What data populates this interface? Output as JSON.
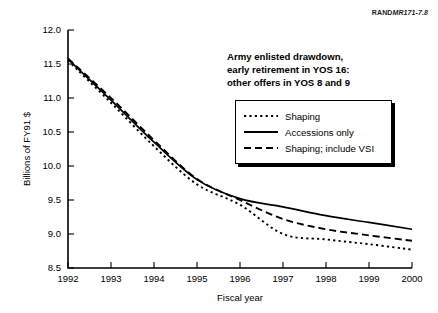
{
  "source_id": {
    "prefix": "RAND",
    "code": "MR171-7.8"
  },
  "annotation": {
    "line1": "Army enlisted drawdown,",
    "line2": "early retirement in YOS 16:",
    "line3": "other offers in YOS 8 and 9"
  },
  "legend": {
    "items": [
      {
        "label": "Shaping",
        "style": "dotted"
      },
      {
        "label": "Accessions only",
        "style": "solid"
      },
      {
        "label": "Shaping; include VSI",
        "style": "dashed"
      }
    ]
  },
  "chart_data": {
    "type": "line",
    "title": "",
    "xlabel": "Fiscal year",
    "ylabel": "Billions of FY91 $",
    "x": [
      1992,
      1993,
      1994,
      1995,
      1996,
      1997,
      1998,
      1999,
      2000
    ],
    "xtick_labels": [
      "1992",
      "1993",
      "1994",
      "1995",
      "1996",
      "1997",
      "1998",
      "1999",
      "2000"
    ],
    "ytick_labels": [
      "8.5",
      "9.0",
      "9.5",
      "10.0",
      "10.5",
      "11.0",
      "11.5",
      "12.0"
    ],
    "ytick_values": [
      8.5,
      9.0,
      9.5,
      10.0,
      10.5,
      11.0,
      11.5,
      12.0
    ],
    "xlim": [
      1992,
      2000
    ],
    "ylim": [
      8.5,
      12.0
    ],
    "grid": false,
    "legend_position": "upper right",
    "series": [
      {
        "name": "Shaping",
        "style": "dotted",
        "values": [
          11.55,
          10.93,
          10.29,
          9.73,
          9.43,
          9.0,
          8.92,
          8.85,
          8.77
        ]
      },
      {
        "name": "Accessions only",
        "style": "solid",
        "values": [
          11.57,
          10.97,
          10.35,
          9.8,
          9.52,
          9.4,
          9.27,
          9.17,
          9.07
        ]
      },
      {
        "name": "Shaping; include VSI",
        "style": "dashed",
        "values": [
          11.58,
          11.0,
          10.38,
          9.81,
          9.5,
          9.22,
          9.07,
          8.98,
          8.9
        ]
      }
    ]
  },
  "colors": {
    "ink": "#000000",
    "background": "#ffffff"
  }
}
